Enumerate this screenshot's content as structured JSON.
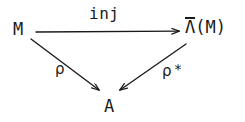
{
  "diagram": {
    "type": "commutative-triangle",
    "background_color": "#ffffff",
    "stroke_color": "#1a1a1a",
    "nodes": [
      {
        "id": "source",
        "label": "M",
        "x": 22,
        "y": 30
      },
      {
        "id": "target",
        "label": "Λ(M)",
        "lambda": "Λ",
        "has_overbar": true,
        "argument": "(M)",
        "x": 203,
        "y": 28
      },
      {
        "id": "codomain",
        "label": "A",
        "x": 112,
        "y": 107
      }
    ],
    "edges": [
      {
        "id": "inj-arrow",
        "from": "source",
        "to": "target",
        "label": "inj",
        "orientation": "horizontal",
        "label_position": "above",
        "arrowhead": "end"
      },
      {
        "id": "rho-arrow",
        "from": "source",
        "to": "codomain",
        "label": "ρ",
        "orientation": "diagonal-down-right",
        "label_position": "left",
        "arrowhead": "end"
      },
      {
        "id": "rho-star-arrow",
        "from": "target",
        "to": "codomain",
        "label": "ρ*",
        "base_symbol": "ρ",
        "superscript": "*",
        "orientation": "diagonal-down-left",
        "label_position": "right",
        "arrowhead": "end"
      }
    ]
  }
}
